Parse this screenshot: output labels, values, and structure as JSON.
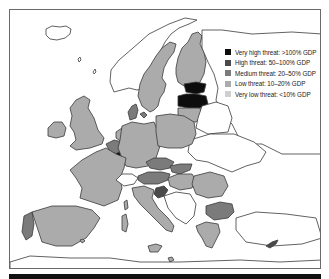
{
  "map": {
    "title": "",
    "region": "Europe",
    "colors": {
      "very_high": "#0d0d0d",
      "high": "#4a4a4a",
      "medium": "#7b7b7b",
      "low": "#ababab",
      "very_low": "#cfcfcf",
      "no_data": "#ffffff",
      "border": "#3a3a3a"
    },
    "legend": {
      "items": [
        {
          "key": "very_high",
          "label": "Very high threat: >100% GDP",
          "color": "#0d0d0d"
        },
        {
          "key": "high",
          "label": "High threat: 50–100% GDP",
          "color": "#4a4a4a"
        },
        {
          "key": "medium",
          "label": "Medium threat: 20–50% GDP",
          "color": "#7b7b7b"
        },
        {
          "key": "low",
          "label": "Low threat: 10–20% GDP",
          "color": "#ababab"
        },
        {
          "key": "very_low",
          "label": "Very low threat: <10% GDP",
          "color": "#cfcfcf"
        }
      ]
    },
    "regions": [
      {
        "name": "Iceland",
        "class": "no_data"
      },
      {
        "name": "Ireland",
        "class": "low"
      },
      {
        "name": "United Kingdom",
        "class": "low"
      },
      {
        "name": "Norway",
        "class": "no_data"
      },
      {
        "name": "Sweden",
        "class": "low"
      },
      {
        "name": "Finland",
        "class": "low"
      },
      {
        "name": "Denmark",
        "class": "medium"
      },
      {
        "name": "Estonia",
        "class": "very_high"
      },
      {
        "name": "Latvia",
        "class": "very_high"
      },
      {
        "name": "Lithuania",
        "class": "low"
      },
      {
        "name": "Netherlands",
        "class": "low"
      },
      {
        "name": "Belgium",
        "class": "medium"
      },
      {
        "name": "Luxembourg",
        "class": "very_high"
      },
      {
        "name": "Germany",
        "class": "low"
      },
      {
        "name": "Poland",
        "class": "low"
      },
      {
        "name": "France",
        "class": "low"
      },
      {
        "name": "Switzerland",
        "class": "no_data"
      },
      {
        "name": "Czech Republic",
        "class": "medium"
      },
      {
        "name": "Slovakia",
        "class": "medium"
      },
      {
        "name": "Austria",
        "class": "medium"
      },
      {
        "name": "Hungary",
        "class": "low"
      },
      {
        "name": "Slovenia",
        "class": "high"
      },
      {
        "name": "Romania",
        "class": "low"
      },
      {
        "name": "Bulgaria",
        "class": "medium"
      },
      {
        "name": "Portugal",
        "class": "medium"
      },
      {
        "name": "Spain",
        "class": "low"
      },
      {
        "name": "Italy",
        "class": "low"
      },
      {
        "name": "Greece",
        "class": "low"
      },
      {
        "name": "Cyprus",
        "class": "high"
      },
      {
        "name": "Malta",
        "class": "low"
      }
    ]
  }
}
